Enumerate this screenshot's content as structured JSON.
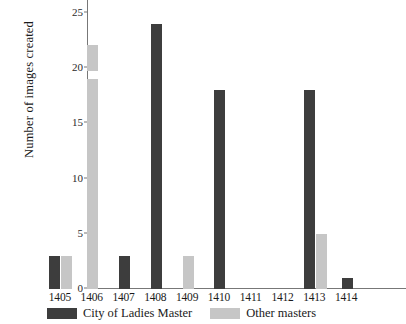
{
  "chart_data": {
    "type": "bar",
    "title": "",
    "xlabel": "",
    "ylabel": "Number of images created",
    "categories": [
      "1405",
      "1406",
      "1407",
      "1408",
      "1409",
      "1410",
      "1411",
      "1412",
      "1413",
      "1414"
    ],
    "series": [
      {
        "name": "City of Ladies Master",
        "color": "#3d3d3d",
        "values": [
          3,
          0,
          3,
          24,
          0,
          18,
          0,
          0,
          18,
          1
        ]
      },
      {
        "name": "Other masters",
        "color": "#c6c6c6",
        "values": [
          3,
          22,
          0,
          0,
          3,
          0,
          0,
          0,
          5,
          0
        ]
      }
    ],
    "ylim": [
      0,
      25
    ],
    "yticks": [
      0,
      5,
      10,
      15,
      20,
      25
    ],
    "ytick_labels": [
      "0",
      "5",
      "10",
      "15",
      "20",
      "25"
    ],
    "grid": false,
    "legend_position": "bottom"
  },
  "legend": {
    "items": [
      {
        "label": "City of Ladies Master",
        "swatch": "dark"
      },
      {
        "label": "Other masters",
        "swatch": "light"
      }
    ]
  },
  "colors": {
    "dark": "#3d3d3d",
    "light": "#c6c6c6",
    "axis": "#777777",
    "text": "#1a1a1a"
  }
}
